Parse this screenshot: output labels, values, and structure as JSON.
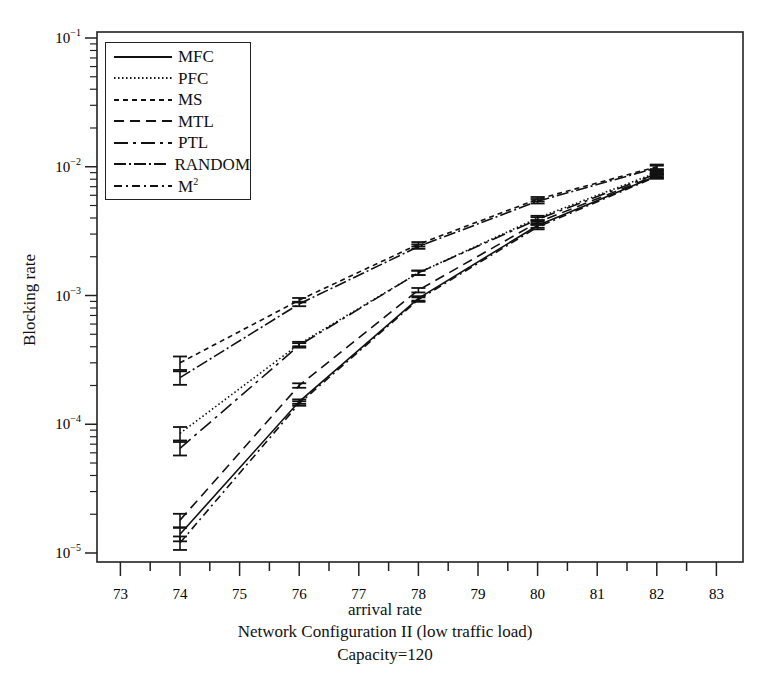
{
  "chart_data": {
    "type": "line",
    "title": "",
    "xlabel": "arrival rate",
    "ylabel": "Blocking rate",
    "subtitle_lines": [
      "Network Configuration II (low traffic load)",
      "Capacity=120"
    ],
    "x_ticks": [
      73,
      74,
      75,
      76,
      77,
      78,
      79,
      80,
      81,
      82,
      83
    ],
    "xlim": [
      72.6,
      83.4
    ],
    "y_scale": "log",
    "y_ticks": [
      "10^-1",
      "10^-2",
      "10^-3",
      "10^-4",
      "10^-5"
    ],
    "ylim": [
      1e-05,
      0.1
    ],
    "grid": false,
    "legend_position": "upper left",
    "error_bars": true,
    "x": [
      74,
      76,
      78,
      80,
      82
    ],
    "series": [
      {
        "name": "MFC",
        "style": "solid",
        "values": [
          1.4e-05,
          0.00015,
          0.00095,
          0.0035,
          0.0085
        ]
      },
      {
        "name": "PFC",
        "style": "dotted",
        "values": [
          8.5e-05,
          0.00042,
          0.0015,
          0.004,
          0.009
        ]
      },
      {
        "name": "MS",
        "style": "short-dash",
        "values": [
          0.0003,
          0.00092,
          0.0025,
          0.0056,
          0.01
        ]
      },
      {
        "name": "MTL",
        "style": "long-dash",
        "values": [
          1.8e-05,
          0.0002,
          0.0011,
          0.0037,
          0.0086
        ]
      },
      {
        "name": "PTL",
        "style": "dash-dot-long",
        "values": [
          6.5e-05,
          0.00041,
          0.0015,
          0.0039,
          0.0088
        ]
      },
      {
        "name": "RANDOM",
        "style": "dash-dot",
        "values": [
          0.00023,
          0.00086,
          0.0024,
          0.0054,
          0.0098
        ]
      },
      {
        "name": "M²",
        "style": "dash-dot-dot",
        "values": [
          1.2e-05,
          0.000145,
          0.00093,
          0.0034,
          0.0084
        ]
      }
    ]
  },
  "labels": {
    "xlabel": "arrival rate",
    "ylabel": "Blocking rate",
    "caption1": "Network Configuration II (low traffic load)",
    "caption2": "Capacity=120"
  },
  "legend": [
    {
      "label": "MFC",
      "dash": ""
    },
    {
      "label": "PFC",
      "dash": "1.5,2.5"
    },
    {
      "label": "MS",
      "dash": "5,4"
    },
    {
      "label": "MTL",
      "dash": "10,6"
    },
    {
      "label": "PTL",
      "dash": "14,5,3,5"
    },
    {
      "label": "RANDOM",
      "dash": "12,3,2,3"
    },
    {
      "label": "M",
      "sup": "2",
      "dash": "8,4,2,4"
    }
  ]
}
